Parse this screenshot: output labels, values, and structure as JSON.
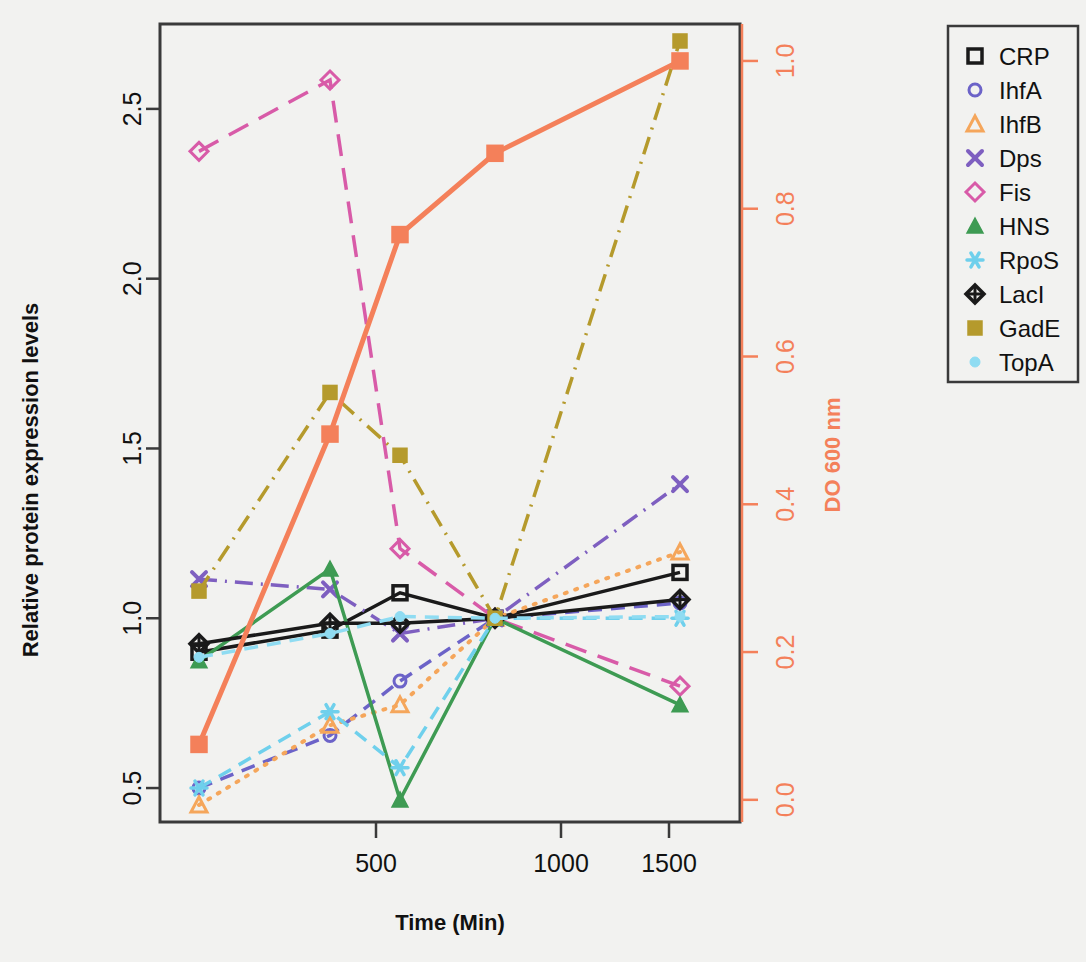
{
  "chart_data": {
    "type": "line",
    "title": "",
    "xlabel": "Time (Min)",
    "ylabel": "Relative protein expression levels",
    "y2label": "DO 600 nm",
    "x_tick_labels": [
      "500",
      "1000",
      "1500"
    ],
    "x_tick_values": [
      500,
      1000,
      1500
    ],
    "x": [
      60,
      360,
      630,
      810,
      1660
    ],
    "y_tick_labels": [
      "0.5",
      "1.0",
      "1.5",
      "2.0",
      "2.5"
    ],
    "y_tick_values": [
      0.5,
      1.0,
      1.5,
      2.0,
      2.5
    ],
    "ylim": [
      0.4,
      2.75
    ],
    "y2_tick_labels": [
      "0.0",
      "0.2",
      "0.4",
      "0.6",
      "0.8",
      "1.0"
    ],
    "y2_tick_values": [
      0.0,
      0.2,
      0.4,
      0.6,
      0.8,
      1.0
    ],
    "y2lim": [
      -0.03,
      1.05
    ],
    "grid": false,
    "legend_position": "right",
    "series": [
      {
        "name": "CRP",
        "axis": "left",
        "color": "#1a1a1a",
        "marker": "square-open",
        "dash": "solid",
        "values": [
          0.9,
          0.965,
          1.075,
          1.0,
          1.135
        ]
      },
      {
        "name": "IhfA",
        "axis": "left",
        "color": "#6c63c8",
        "marker": "circle-open",
        "dash": "dashed",
        "values": [
          0.5,
          0.655,
          0.815,
          1.0,
          1.045
        ]
      },
      {
        "name": "IhfB",
        "axis": "left",
        "color": "#F5A65B",
        "marker": "triangle-open",
        "dash": "dotted",
        "values": [
          0.45,
          0.685,
          0.745,
          1.0,
          1.195
        ]
      },
      {
        "name": "Dps",
        "axis": "left",
        "color": "#7E5FC0",
        "marker": "cross",
        "dash": "dashdot",
        "values": [
          1.115,
          1.085,
          0.955,
          1.0,
          1.395
        ]
      },
      {
        "name": "Fis",
        "axis": "left",
        "color": "#D85BA8",
        "marker": "diamond-open",
        "dash": "longdash",
        "values": [
          2.375,
          2.585,
          1.205,
          1.0,
          0.8
        ]
      },
      {
        "name": "HNS",
        "axis": "left",
        "color": "#3E9B53",
        "marker": "triangle-fill",
        "dash": "solid",
        "values": [
          0.875,
          1.145,
          0.465,
          1.0,
          0.745
        ]
      },
      {
        "name": "RpoS",
        "axis": "left",
        "color": "#6FD0EC",
        "marker": "asterisk",
        "dash": "dashed",
        "values": [
          0.5,
          0.725,
          0.56,
          1.0,
          1.0
        ]
      },
      {
        "name": "LacI",
        "axis": "left",
        "color": "#1a1a1a",
        "marker": "diamond-plus",
        "dash": "solid",
        "values": [
          0.925,
          0.985,
          0.985,
          1.0,
          1.055
        ]
      },
      {
        "name": "GadE",
        "axis": "left",
        "color": "#B59A2C",
        "marker": "square-fill",
        "dash": "dashdot",
        "values": [
          1.08,
          1.665,
          1.48,
          1.0,
          2.7
        ]
      },
      {
        "name": "TopA",
        "axis": "left",
        "color": "#8FDCF2",
        "marker": "dot",
        "dash": "dashed",
        "values": [
          0.885,
          0.955,
          1.005,
          1.0,
          1.005
        ]
      },
      {
        "name": "DO600",
        "axis": "right",
        "color": "#F4805A",
        "marker": "square-fill-orange",
        "dash": "solid",
        "values": [
          0.075,
          0.495,
          0.765,
          0.875,
          1.0
        ]
      }
    ]
  },
  "legend": {
    "entries": [
      {
        "label": "CRP"
      },
      {
        "label": "IhfA"
      },
      {
        "label": "IhfB"
      },
      {
        "label": "Dps"
      },
      {
        "label": "Fis"
      },
      {
        "label": "HNS"
      },
      {
        "label": "RpoS"
      },
      {
        "label": "LacI"
      },
      {
        "label": "GadE"
      },
      {
        "label": "TopA"
      }
    ]
  },
  "colors": {
    "accent_orange": "#F4805A",
    "frame": "#3a3a3a",
    "background": "#f2f2f0"
  }
}
